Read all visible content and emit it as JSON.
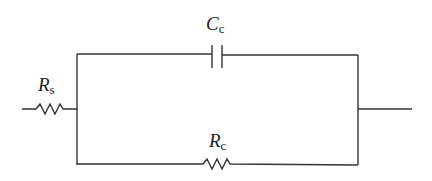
{
  "diagram": {
    "type": "circuit",
    "labels": {
      "rs": {
        "symbol": "R",
        "subscript": "s"
      },
      "cc": {
        "symbol": "C",
        "subscript": "c"
      },
      "rc": {
        "symbol": "R",
        "subscript": "c"
      }
    },
    "components": [
      {
        "id": "Rs",
        "kind": "resistor",
        "position": "series input"
      },
      {
        "id": "Cc",
        "kind": "capacitor",
        "position": "upper parallel branch"
      },
      {
        "id": "Rc",
        "kind": "resistor",
        "position": "lower parallel branch"
      }
    ],
    "line_color": "#333333"
  }
}
